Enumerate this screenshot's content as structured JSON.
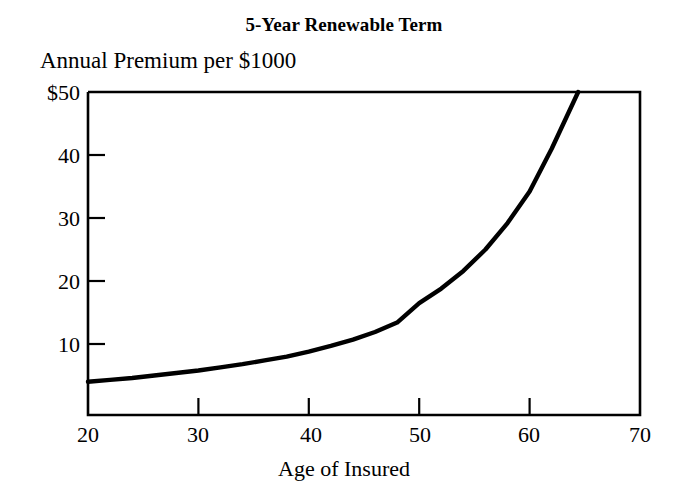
{
  "chart_data": {
    "type": "line",
    "title": "5-Year Renewable Term",
    "ylabel": "Annual Premium per $1000",
    "xlabel": "Age of Insured",
    "xlim": [
      20,
      70
    ],
    "ylim": [
      0,
      50
    ],
    "grid": false,
    "legend": null,
    "x_ticks": [
      20,
      30,
      40,
      50,
      60,
      70
    ],
    "x_tick_labels": [
      "20",
      "30",
      "40",
      "50",
      "60",
      "70"
    ],
    "y_ticks": [
      10,
      20,
      30,
      40,
      50
    ],
    "y_tick_labels": [
      "10",
      "20",
      "30",
      "40",
      "$50"
    ],
    "series": [
      {
        "name": "Annual Premium per $1000",
        "x": [
          20,
          22,
          24,
          26,
          28,
          30,
          32,
          34,
          36,
          38,
          40,
          42,
          44,
          46,
          48,
          50,
          52,
          54,
          56,
          58,
          60,
          62,
          64.4
        ],
        "values": [
          4.0,
          4.3,
          4.6,
          5.0,
          5.4,
          5.8,
          6.3,
          6.8,
          7.4,
          8.0,
          8.8,
          9.7,
          10.7,
          11.9,
          13.4,
          16.5,
          18.8,
          21.6,
          25.0,
          29.2,
          34.2,
          41.0,
          50.0
        ]
      }
    ],
    "annotations": []
  },
  "figure": {
    "title_text": "5-Year Renewable Term",
    "y_axis_caption": "Annual Premium per $1000",
    "x_axis_caption": "Age of Insured",
    "line_color": "#000000",
    "axis_color": "#000000",
    "background_color": "#ffffff"
  }
}
